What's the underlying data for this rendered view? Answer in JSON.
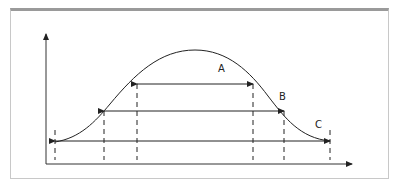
{
  "diagram": {
    "type": "bell-curve-with-width-levels",
    "labels": {
      "a": "A",
      "b": "B",
      "c": "C"
    },
    "colors": {
      "line": "#222222",
      "frame_top": "#9a9a9a",
      "frame_border": "#c8c8c8",
      "background": "#ffffff"
    }
  }
}
